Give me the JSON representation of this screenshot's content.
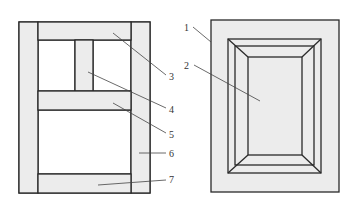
{
  "colors": {
    "stroke": "#2a2a2a",
    "fill": "#ececec",
    "leader": "#444444",
    "background": "#ffffff"
  },
  "left_diagram": {
    "title": "Frame door structure",
    "labels": [
      {
        "id": "3",
        "text": "3"
      },
      {
        "id": "4",
        "text": "4"
      },
      {
        "id": "5",
        "text": "5"
      },
      {
        "id": "6",
        "text": "6"
      },
      {
        "id": "7",
        "text": "7"
      }
    ]
  },
  "right_diagram": {
    "title": "Raised panel door",
    "labels": [
      {
        "id": "1",
        "text": "1"
      },
      {
        "id": "2",
        "text": "2"
      }
    ]
  }
}
